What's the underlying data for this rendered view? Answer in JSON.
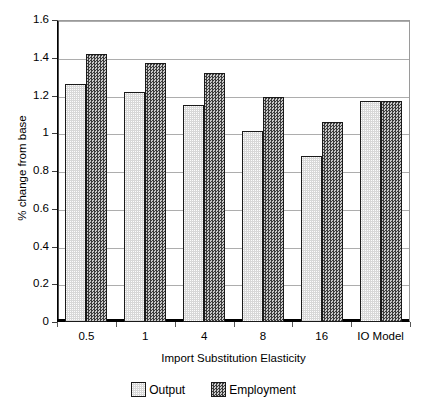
{
  "chart_data": {
    "type": "bar",
    "title": "",
    "categories": [
      "0.5",
      "1",
      "4",
      "8",
      "16",
      "IO Model"
    ],
    "series": [
      {
        "name": "Output",
        "values": [
          1.26,
          1.22,
          1.15,
          1.01,
          0.88,
          1.17
        ],
        "color": "#d8d8d8"
      },
      {
        "name": "Employment",
        "values": [
          1.42,
          1.37,
          1.32,
          1.19,
          1.06,
          1.17
        ],
        "color": "#6b6b6b"
      }
    ],
    "xlabel": "Import Substitution Elasticity",
    "ylabel": "% change from base",
    "ylim": [
      0,
      1.6
    ],
    "ytick_labels": [
      "1.6",
      "1.4",
      "1.2",
      "1",
      "0.8",
      "0.6",
      "0.4",
      "0.2",
      "0"
    ],
    "ytick_values": [
      1.6,
      1.4,
      1.2,
      1.0,
      0.8,
      0.6,
      0.4,
      0.2,
      0
    ],
    "grid": "horizontal",
    "legend_position": "bottom"
  },
  "legend": {
    "items": [
      {
        "label": "Output",
        "swatch": "output-swatch"
      },
      {
        "label": "Employment",
        "swatch": "employment-swatch"
      }
    ]
  }
}
